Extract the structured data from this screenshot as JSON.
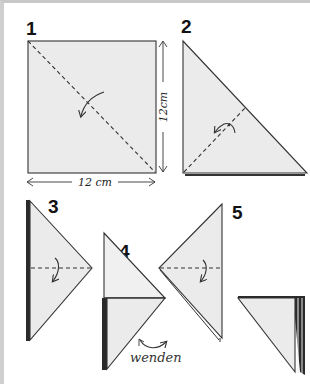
{
  "diagram": {
    "type": "origami-folding-instructions",
    "steps": [
      {
        "number": "1",
        "shape": "square",
        "fold": "diagonal valley fold",
        "dimensions": {
          "width_label": "12 cm",
          "height_label": "12cm"
        }
      },
      {
        "number": "2",
        "shape": "right triangle",
        "fold": "fold in half along dashed line"
      },
      {
        "number": "3",
        "shape": "triangle pointing right",
        "fold": "horizontal fold"
      },
      {
        "number": "4",
        "shape": "triangle pointing right with crease",
        "note": "wenden"
      },
      {
        "number": "5",
        "shape": "triangle pointing left",
        "fold": "horizontal fold"
      },
      {
        "number": "6",
        "shape": "folded result"
      }
    ],
    "turn_label": "wenden",
    "colors": {
      "paper": "#ebebeb",
      "line": "#333333",
      "border": "#c8c8c8"
    }
  }
}
